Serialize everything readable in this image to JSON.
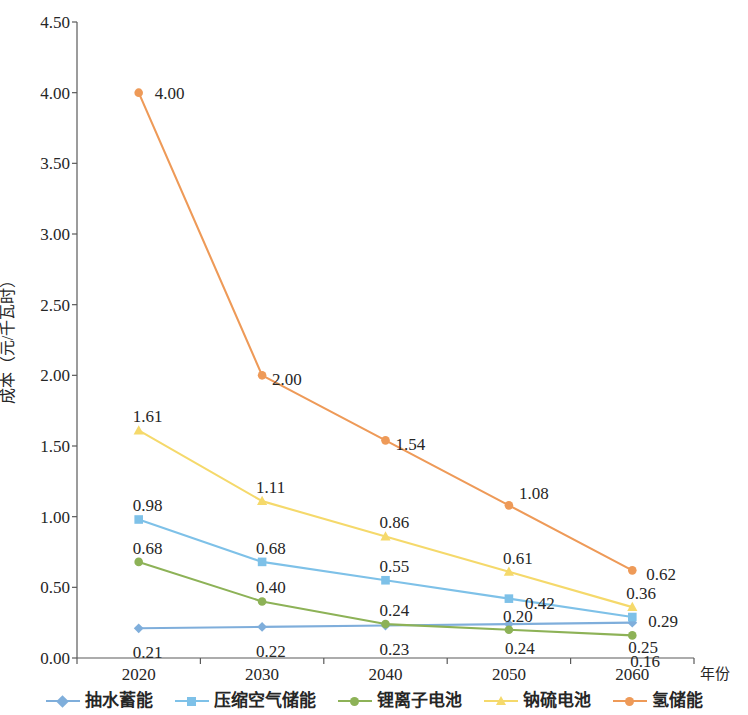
{
  "chart_data": {
    "type": "line",
    "title": "",
    "xlabel": "年份",
    "ylabel": "成本（元/千瓦时）",
    "categories": [
      "2020",
      "2030",
      "2040",
      "2050",
      "2060"
    ],
    "x_ticklabels": [
      "2020",
      "2030",
      "2040",
      "2050",
      "2060"
    ],
    "y_ticklabels": [
      "0.00",
      "0.50",
      "1.00",
      "1.50",
      "2.00",
      "2.50",
      "3.00",
      "3.50",
      "4.00",
      "4.50"
    ],
    "y_tickvalues": [
      0.0,
      0.5,
      1.0,
      1.5,
      2.0,
      2.5,
      3.0,
      3.5,
      4.0,
      4.5
    ],
    "ylim": [
      0,
      4.5
    ],
    "grid": false,
    "legend_position": "bottom",
    "series": [
      {
        "name": "抽水蓄能",
        "color": "#7FAEDB",
        "marker": "diamond",
        "values": [
          0.21,
          0.22,
          0.23,
          0.24,
          0.25
        ],
        "labels": [
          "0.21",
          "0.22",
          "0.23",
          "0.24",
          "0.25"
        ]
      },
      {
        "name": "压缩空气储能",
        "color": "#7EC1E8",
        "marker": "square",
        "values": [
          0.98,
          0.68,
          0.55,
          0.42,
          0.29
        ],
        "labels": [
          "0.98",
          "0.68",
          "0.55",
          "0.42",
          "0.29"
        ]
      },
      {
        "name": "锂离子电池",
        "color": "#8DB257",
        "marker": "circle",
        "values": [
          0.68,
          0.4,
          0.24,
          0.2,
          0.16
        ],
        "labels": [
          "0.68",
          "0.40",
          "0.24",
          "0.20",
          "0.16"
        ]
      },
      {
        "name": "钠硫电池",
        "color": "#F5D96B",
        "marker": "triangle",
        "values": [
          1.61,
          1.11,
          0.86,
          0.61,
          0.36
        ],
        "labels": [
          "1.61",
          "1.11",
          "0.86",
          "0.61",
          "0.36"
        ]
      },
      {
        "name": "氢储能",
        "color": "#EE9A58",
        "marker": "circle",
        "values": [
          4.0,
          2.0,
          1.54,
          1.08,
          0.62
        ],
        "labels": [
          "4.00",
          "2.00",
          "1.54",
          "1.08",
          "0.62"
        ]
      }
    ],
    "label_offsets": [
      [
        [
          -6,
          16
        ],
        [
          -6,
          16
        ],
        [
          -6,
          16
        ],
        [
          -4,
          16
        ],
        [
          -4,
          16
        ]
      ],
      [
        [
          -6,
          -22
        ],
        [
          -6,
          -22
        ],
        [
          -6,
          -22
        ],
        [
          16,
          -4
        ],
        [
          16,
          -4
        ]
      ],
      [
        [
          -6,
          -22
        ],
        [
          -6,
          -22
        ],
        [
          -6,
          -22
        ],
        [
          -6,
          -22
        ],
        [
          -2,
          18
        ]
      ],
      [
        [
          -6,
          -22
        ],
        [
          -6,
          -22
        ],
        [
          -6,
          -22
        ],
        [
          -6,
          -22
        ],
        [
          -6,
          -22
        ]
      ],
      [
        [
          16,
          -8
        ],
        [
          10,
          -4
        ],
        [
          10,
          -4
        ],
        [
          10,
          -20
        ],
        [
          14,
          -4
        ]
      ]
    ],
    "axis_color": "#5a5a5a"
  }
}
